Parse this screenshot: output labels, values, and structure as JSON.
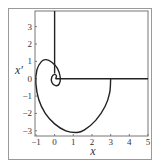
{
  "chart_data": {
    "type": "line",
    "title": "",
    "xlabel": "x",
    "ylabel": "x′",
    "xlim": [
      -1.05,
      5
    ],
    "ylim": [
      -3.3,
      3.9
    ],
    "xticks": [
      -1,
      0,
      1,
      2,
      3,
      4,
      5
    ],
    "yticks": [
      -3,
      -2,
      -1,
      0,
      1,
      2,
      3
    ],
    "grid": false,
    "legend": null,
    "series": [
      {
        "name": "phase trajectory (spiral)",
        "x": [
          3,
          2.95,
          2.7,
          2.2,
          1.6,
          1.2,
          0.6,
          0,
          -0.5,
          -0.85,
          -1.0,
          -0.95,
          -0.7,
          -0.45,
          -0.15,
          0.15,
          0.3,
          0.25,
          0.05,
          -0.15,
          -0.15,
          0,
          0.1,
          0.05
        ],
        "y": [
          0,
          -0.8,
          -1.6,
          -2.4,
          -2.95,
          -3.1,
          -3.0,
          -2.6,
          -2.0,
          -1.2,
          -0.3,
          0.5,
          1.0,
          1.1,
          0.95,
          0.6,
          0.1,
          -0.3,
          -0.4,
          -0.2,
          0.1,
          0.25,
          0.15,
          0
        ]
      },
      {
        "name": "vertical line x = 0",
        "x": [
          0,
          0
        ],
        "y": [
          3.9,
          0.3
        ]
      },
      {
        "name": "horizontal line x' = 0",
        "x": [
          0.05,
          5
        ],
        "y": [
          0,
          0
        ]
      }
    ]
  },
  "layout": {
    "plot_px": {
      "left": 35,
      "top": 11,
      "right": 148,
      "bottom": 136
    },
    "line_color": "#222222",
    "axis_color": "#777777"
  }
}
